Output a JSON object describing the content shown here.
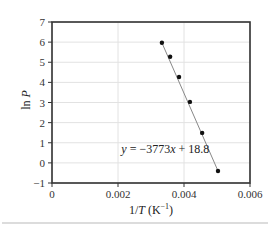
{
  "chart_data": {
    "type": "scatter",
    "title": "",
    "xlabel": "1/T (K⁻¹)",
    "xlabel_parts": {
      "prefix": "1/",
      "var": "T",
      "unit": " (K",
      "exp": "−1",
      "close": ")"
    },
    "ylabel": "ln P",
    "ylabel_parts": {
      "fn": "ln ",
      "var": "P"
    },
    "xlim": [
      0,
      0.006
    ],
    "ylim": [
      -1,
      7
    ],
    "x_ticks": [
      0,
      0.002,
      0.004,
      0.006
    ],
    "x_tick_labels": [
      "0",
      "0.002",
      "0.004",
      "0.006"
    ],
    "y_ticks": [
      -1,
      0,
      1,
      2,
      3,
      4,
      5,
      6,
      7
    ],
    "y_tick_labels": [
      "−1",
      "0",
      "1",
      "2",
      "3",
      "4",
      "5",
      "6",
      "7"
    ],
    "grid": true,
    "legend": null,
    "series": [
      {
        "name": "data",
        "marker": "circle",
        "x": [
          0.00333,
          0.00358,
          0.00385,
          0.00418,
          0.00455,
          0.00503
        ],
        "y": [
          5.97,
          5.27,
          4.27,
          3.03,
          1.49,
          -0.4
        ]
      }
    ],
    "fit_line": {
      "slope": -3773,
      "intercept": 18.8,
      "x_range": [
        0.00333,
        0.00503
      ]
    },
    "annotations": [
      {
        "text": "y = −3773x + 18.8",
        "x": 0.0021,
        "y": 0.7
      }
    ],
    "annotation_parts": {
      "var": "y",
      "eq": " = −3773",
      "xvar": "x",
      "rest": " + 18.8"
    }
  },
  "colors": {
    "axis": "#333333",
    "grid": "#e2e2e2",
    "marker": "#111111",
    "fit_line": "#888888",
    "divider": "#dcdcdc"
  }
}
